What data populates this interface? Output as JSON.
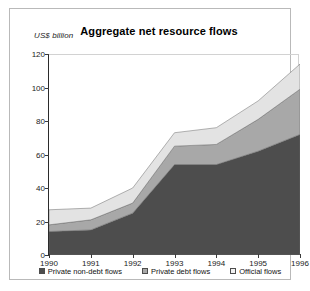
{
  "chart_data": {
    "type": "area",
    "title": "Aggregate net resource flows",
    "subtitle": "",
    "xlabel": "",
    "ylabel": "US$ billion",
    "categories": [
      "1990",
      "1991",
      "1992",
      "1993",
      "1994",
      "1995",
      "1996"
    ],
    "x": [
      1990,
      1991,
      1992,
      1993,
      1994,
      1995,
      1996
    ],
    "stacked": true,
    "grid": false,
    "legend_position": "bottom",
    "ylim": [
      0,
      120
    ],
    "yticks": [
      "0",
      "20",
      "40",
      "60",
      "80",
      "100",
      "120"
    ],
    "ytick_values": [
      0,
      20,
      40,
      60,
      80,
      100,
      120
    ],
    "series": [
      {
        "name": "Private non-debt flows",
        "color": "#4d4d4d",
        "values": [
          14,
          15,
          25,
          54,
          54,
          62,
          72
        ]
      },
      {
        "name": "Private debt flows",
        "color": "#a8a8a8",
        "values": [
          4,
          6,
          6,
          11,
          12,
          19,
          27
        ]
      },
      {
        "name": "Official flows",
        "color": "#e3e3e3",
        "values": [
          9,
          7,
          9,
          8,
          10,
          11,
          15
        ]
      }
    ],
    "cumulative_totals": [
      27,
      28,
      40,
      73,
      76,
      92,
      114
    ]
  },
  "legend": {
    "items": [
      {
        "label": "Private non-debt flows",
        "color": "#4d4d4d"
      },
      {
        "label": "Private debt flows",
        "color": "#a8a8a8"
      },
      {
        "label": "Official flows",
        "color": "#f2f2f2"
      }
    ]
  }
}
